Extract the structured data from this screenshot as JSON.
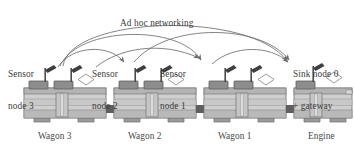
{
  "figure": {
    "title": "Ad hoc networking",
    "type": "train sensor network diagram"
  },
  "network": {
    "headline": "Ad hoc networking",
    "nodes": [
      {
        "id": "node3",
        "label": "Sensor\nnode 3",
        "vehicle": "Wagon 3"
      },
      {
        "id": "node2",
        "label": "Sensor\nnode 2",
        "vehicle": "Wagon 2"
      },
      {
        "id": "node1",
        "label": "Sensor\nnode 1",
        "vehicle": "Wagon 1"
      },
      {
        "id": "node0",
        "label": "Sink node 0\n+ gateway",
        "vehicle": "Engine"
      }
    ]
  },
  "vehicles": [
    {
      "id": "wagon3",
      "caption": "Wagon 3"
    },
    {
      "id": "wagon2",
      "caption": "Wagon 2"
    },
    {
      "id": "wagon1",
      "caption": "Wagon 1"
    },
    {
      "id": "engine",
      "caption": "Engine"
    }
  ],
  "labels": {
    "sensor_node_3_line1": "Sensor",
    "sensor_node_3_line2": "node 3",
    "sensor_node_2_line1": "Sensor",
    "sensor_node_2_line2": "node 2",
    "sensor_node_1_line1": "Sensor",
    "sensor_node_1_line2": "node 1",
    "sink_node_line1": "Sink node 0",
    "sink_node_line2": "+ gateway",
    "headline": "Ad hoc networking",
    "caption_wagon3": "Wagon 3",
    "caption_wagon2": "Wagon 2",
    "caption_wagon1": "Wagon 1",
    "caption_engine": "Engine"
  },
  "colors": {
    "background": "#ffffff",
    "text": "#3b3b3b",
    "arc_stroke": "#6e6e6e",
    "body_light": "#d3d3d3",
    "body_mid": "#c2c2c2",
    "body_dark": "#a8a8a8",
    "roof_box": "#8f8f8f",
    "wheel": "#9a9a9a",
    "outline": "#6b6b6b",
    "antenna": "#4c4c4c"
  }
}
